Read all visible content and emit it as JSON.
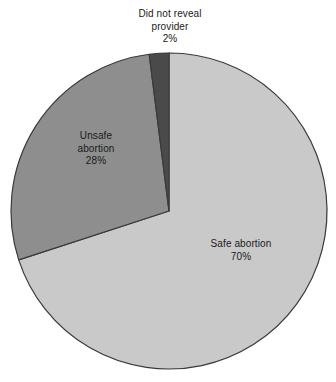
{
  "chart_data": {
    "type": "pie",
    "title": "",
    "subtitle": "",
    "xlabel": "",
    "ylabel": "",
    "grid": false,
    "legend_position": "none",
    "units": "percent",
    "categories": [
      "Safe abortion",
      "Unsafe abortion",
      "Did not reveal provider"
    ],
    "values": [
      70,
      28,
      2
    ],
    "slices": [
      {
        "label": "Safe abortion",
        "value": 70,
        "value_text": "70%",
        "color": "#c9c9c9",
        "label_line_1": "Safe abortion",
        "label_line_2": "70%",
        "label_placement": "inside"
      },
      {
        "label": "Unsafe abortion",
        "value": 28,
        "value_text": "28%",
        "color": "#8e8e8e",
        "label_line_1": "Unsafe",
        "label_line_2": "abortion",
        "label_line_3": "28%",
        "label_placement": "inside"
      },
      {
        "label": "Did not reveal provider",
        "value": 2,
        "value_text": "2%",
        "color": "#4a4a4a",
        "label_line_1": "Did not reveal",
        "label_line_2": "provider",
        "label_line_3": "2%",
        "label_placement": "outside-top"
      }
    ],
    "geometry": {
      "center_x": 169,
      "center_y": 211,
      "radius": 158,
      "start_angle_deg": 0,
      "direction": "clockwise"
    },
    "colors": {
      "background": "#ffffff",
      "outline": "#3a3a3a",
      "safe": "#c9c9c9",
      "unsafe": "#8e8e8e",
      "did_not_reveal": "#4a4a4a",
      "text": "#1a1a1a"
    }
  }
}
